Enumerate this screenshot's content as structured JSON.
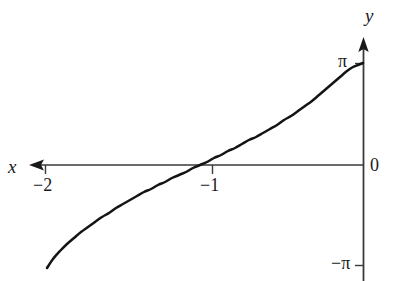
{
  "figure": {
    "width": 393,
    "height": 281,
    "background": "#ffffff",
    "curve_color": "#141414",
    "axis_color": "#3a3a3a",
    "text_color": "#1a1a1a"
  },
  "axes": {
    "x_axis": {
      "label": "x",
      "name": "x-axis",
      "arrow_direction": "left",
      "pixel_y": 165,
      "pixel_x_start": 30,
      "pixel_x_end": 364
    },
    "y_axis": {
      "label": "y",
      "name": "y-axis",
      "arrow_direction": "up",
      "pixel_x": 363,
      "pixel_y_start": 38,
      "pixel_y_end": 281
    }
  },
  "ticks": {
    "x": [
      {
        "label": "−2",
        "value": -2,
        "pixel_x": 45
      },
      {
        "label": "−1",
        "value": -1,
        "pixel_x": 212
      }
    ],
    "y": [
      {
        "label": "π",
        "value": 3.14159,
        "pixel_y": 63
      },
      {
        "label": "0",
        "value": 0,
        "pixel_y": 165
      },
      {
        "label": "−π",
        "value": -3.14159,
        "pixel_y": 265
      }
    ]
  },
  "chart_data": {
    "type": "line",
    "title": "",
    "xlabel": "x",
    "ylabel": "y",
    "xlim": [
      -2.2,
      0
    ],
    "ylim": [
      -3.6,
      3.6
    ],
    "grid": false,
    "legend": null,
    "axis_ticks": {
      "x": [
        -2,
        -1
      ],
      "x_labels": [
        "−2",
        "−1"
      ],
      "y": [
        -3.14159,
        0,
        3.14159
      ],
      "y_labels": [
        "−π",
        "0",
        "π"
      ]
    },
    "annotations": [
      {
        "text": "x",
        "role": "x-axis-name"
      },
      {
        "text": "y",
        "role": "y-axis-name"
      },
      {
        "text": "0",
        "role": "origin-label"
      }
    ],
    "series": [
      {
        "name": "curve",
        "description": "increasing curve from lower-left rising steeply to π at x = 0, crossing zero at x = -1",
        "x": [
          -2.0,
          -1.95,
          -1.9,
          -1.85,
          -1.8,
          -1.75,
          -1.7,
          -1.65,
          -1.6,
          -1.55,
          -1.5,
          -1.45,
          -1.4,
          -1.35,
          -1.3,
          -1.25,
          -1.2,
          -1.15,
          -1.1,
          -1.05,
          -1.0,
          -0.95,
          -0.9,
          -0.85,
          -0.8,
          -0.75,
          -0.7,
          -0.65,
          -0.6,
          -0.55,
          -0.5,
          -0.45,
          -0.4,
          -0.35,
          -0.3,
          -0.25,
          -0.2,
          -0.15,
          -0.1,
          -0.05,
          -0.02,
          0.0
        ],
        "y": [
          -3.14159,
          -2.69057,
          -2.4981,
          -2.35619,
          -2.24117,
          -2.14306,
          -2.05685,
          -1.97941,
          -1.90876,
          -1.84352,
          -1.7827,
          -1.72557,
          -1.67155,
          -1.6202,
          -1.57116,
          -1.52415,
          -1.47894,
          -1.4353,
          -1.39308,
          -1.35212,
          -1.3123,
          -1.2735,
          -1.23562,
          -1.19857,
          -1.16228,
          -1.12669,
          -1.09172,
          -1.05733,
          -1.02347,
          -0.99011,
          -0.9572,
          -0.92471,
          -0.89262,
          -0.86091,
          -0.82953,
          -0.79848,
          -0.76774,
          -0.73728,
          -0.7071,
          -0.67717,
          -0.65924,
          3.14159
        ],
        "pixel_points": [
          [
            47,
            268
          ],
          [
            53,
            259
          ],
          [
            60,
            251
          ],
          [
            67,
            244
          ],
          [
            74,
            238
          ],
          [
            81,
            232
          ],
          [
            88,
            227
          ],
          [
            95,
            222
          ],
          [
            102,
            217
          ],
          [
            109,
            213
          ],
          [
            116,
            208
          ],
          [
            123,
            204
          ],
          [
            130,
            200
          ],
          [
            137,
            196
          ],
          [
            144,
            192
          ],
          [
            151,
            189
          ],
          [
            158,
            185
          ],
          [
            165,
            182
          ],
          [
            172,
            178
          ],
          [
            179,
            175
          ],
          [
            186,
            172
          ],
          [
            193,
            168
          ],
          [
            200,
            165
          ],
          [
            207,
            162
          ],
          [
            214,
            158
          ],
          [
            221,
            155
          ],
          [
            228,
            151
          ],
          [
            235,
            148
          ],
          [
            242,
            144
          ],
          [
            249,
            140
          ],
          [
            256,
            137
          ],
          [
            263,
            133
          ],
          [
            270,
            129
          ],
          [
            277,
            125
          ],
          [
            284,
            120
          ],
          [
            291,
            116
          ],
          [
            298,
            111
          ],
          [
            305,
            106
          ],
          [
            312,
            101
          ],
          [
            319,
            95
          ],
          [
            326,
            89
          ],
          [
            333,
            83
          ],
          [
            340,
            77
          ],
          [
            347,
            71
          ],
          [
            353,
            67
          ],
          [
            358,
            65
          ],
          [
            363,
            63
          ]
        ]
      }
    ]
  }
}
